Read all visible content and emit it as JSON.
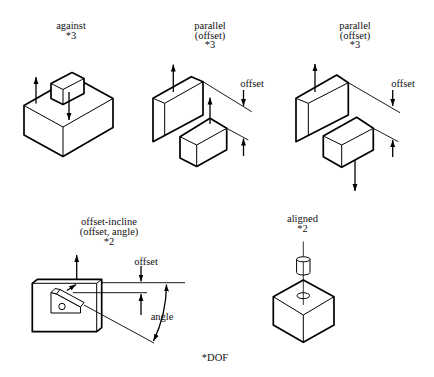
{
  "figure": {
    "panels": [
      {
        "id": "against",
        "title": "against",
        "dof": "*3"
      },
      {
        "id": "parallel-offset-up",
        "title": "parallel",
        "subtitle": "(offset)",
        "dof": "*3",
        "dimension_label": "offset"
      },
      {
        "id": "parallel-offset-down",
        "title": "parallel",
        "subtitle": "(offset)",
        "dof": "*3",
        "dimension_label": "offset"
      },
      {
        "id": "offset-incline",
        "title": "offset-incline",
        "subtitle": "(offset, angle)",
        "dof": "*2",
        "offset_label": "offset",
        "angle_label": "angle"
      },
      {
        "id": "aligned",
        "title": "aligned",
        "dof": "*2"
      }
    ],
    "footnote": "*DOF"
  },
  "colors": {
    "stroke": "#000000",
    "background": "#ffffff",
    "text": "#111111"
  }
}
